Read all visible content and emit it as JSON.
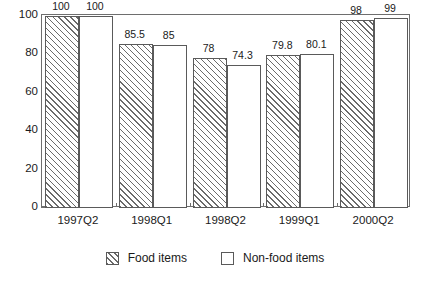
{
  "chart_data": {
    "type": "bar",
    "title": "",
    "subtitle": "",
    "xlabel": "",
    "ylabel": "",
    "ylim": [
      0,
      100
    ],
    "yticks": [
      0,
      20,
      40,
      60,
      80,
      100
    ],
    "ytick_labels": [
      "0",
      "20",
      "40",
      "60",
      "80",
      "100"
    ],
    "grid": false,
    "legend_position": "bottom",
    "categories": [
      "1997Q2",
      "1998Q1",
      "1998Q2",
      "1999Q1",
      "2000Q2"
    ],
    "series": [
      {
        "name": "Food items",
        "fill": "diagonal-hatch",
        "values": [
          100,
          85.5,
          78,
          79.8,
          98
        ],
        "value_labels": [
          "100",
          "85.5",
          "78",
          "79.8",
          "98"
        ]
      },
      {
        "name": "Non-food items",
        "fill": "white",
        "values": [
          100,
          85,
          74.3,
          80.1,
          99
        ],
        "value_labels": [
          "100",
          "85",
          "74.3",
          "80.1",
          "99"
        ]
      }
    ]
  },
  "legend": {
    "items": [
      {
        "label": "Food items",
        "swatch": "hatched-square-icon"
      },
      {
        "label": "Non-food items",
        "swatch": "empty-square-icon"
      }
    ]
  },
  "colors": {
    "axis": "#6e6e6e",
    "bar_outline": "#5a5a5a",
    "hatch": "#6b6b6b",
    "text": "#1a1a1a",
    "background": "#ffffff"
  }
}
